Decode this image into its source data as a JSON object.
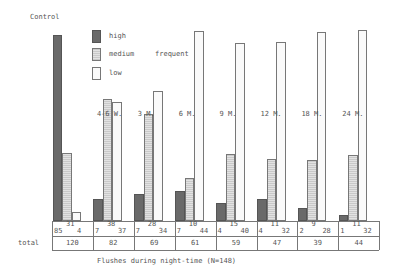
{
  "chart_data": {
    "type": "bar",
    "title": "",
    "xlabel": "Flushes during night-time (N=148)",
    "ylabel": "",
    "y_unit": "percent of group total",
    "ylim": [
      0,
      100
    ],
    "grid": false,
    "legend_position": "top-left inside",
    "legend_group_label": "frequent",
    "categories": [
      "Control",
      "4-6 W.",
      "3 M.",
      "6 M.",
      "9 M.",
      "12 M.",
      "18 M.",
      "24 M."
    ],
    "series": [
      {
        "name": "high",
        "values": [
          85,
          7,
          7,
          7,
          4,
          4,
          2,
          1
        ]
      },
      {
        "name": "medium",
        "values": [
          31,
          38,
          28,
          10,
          15,
          11,
          9,
          11
        ]
      },
      {
        "name": "low",
        "values": [
          4,
          37,
          34,
          44,
          40,
          32,
          28,
          32
        ]
      }
    ],
    "totals": [
      120,
      82,
      69,
      61,
      59,
      47,
      39,
      44
    ],
    "total_row_label": "total"
  },
  "labels": {
    "control": "Control",
    "frequent": "frequent",
    "total": "total",
    "xlabel": "Flushes during night-time (N=148)",
    "legend": [
      "high",
      "medium",
      "low"
    ]
  }
}
